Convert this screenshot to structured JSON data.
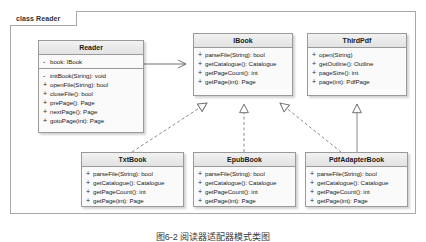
{
  "frame": {
    "label": "class Reader"
  },
  "classes": [
    {
      "id": "reader",
      "name": "Reader",
      "attributes": [
        {
          "visibility": "-",
          "signature": "book: IBook"
        }
      ],
      "operations": [
        {
          "visibility": "-",
          "signature": "initBook(String): void"
        },
        {
          "visibility": "+",
          "signature": "openFile(String): bool"
        },
        {
          "visibility": "+",
          "signature": "closeFile(): bool"
        },
        {
          "visibility": "+",
          "signature": "prePage(): Page"
        },
        {
          "visibility": "+",
          "signature": "nextPage(): Page"
        },
        {
          "visibility": "+",
          "signature": "gotoPage(int): Page"
        }
      ]
    },
    {
      "id": "ibook",
      "name": "IBook",
      "attributes": [],
      "operations": [
        {
          "visibility": "+",
          "signature": "parseFile(String): bool"
        },
        {
          "visibility": "+",
          "signature": "getCatalogue(): Catalogue"
        },
        {
          "visibility": "+",
          "signature": "getPageCount(): int"
        },
        {
          "visibility": "+",
          "signature": "getPage(int): Page"
        }
      ]
    },
    {
      "id": "thirdpdf",
      "name": "ThirdPdf",
      "attributes": [],
      "operations": [
        {
          "visibility": "+",
          "signature": "open(String)"
        },
        {
          "visibility": "+",
          "signature": "getOutline(): Outline"
        },
        {
          "visibility": "+",
          "signature": "pageSize(): int"
        },
        {
          "visibility": "+",
          "signature": "page(int): PdfPage"
        }
      ]
    },
    {
      "id": "txtbook",
      "name": "TxtBook",
      "attributes": [],
      "operations": [
        {
          "visibility": "+",
          "signature": "parseFile(String): bool"
        },
        {
          "visibility": "+",
          "signature": "getCatalogue(): Catalogue"
        },
        {
          "visibility": "+",
          "signature": "getPageCount(): int"
        },
        {
          "visibility": "+",
          "signature": "getPage(int): Page"
        }
      ]
    },
    {
      "id": "epubbook",
      "name": "EpubBook",
      "attributes": [],
      "operations": [
        {
          "visibility": "+",
          "signature": "parseFile(String): bool"
        },
        {
          "visibility": "+",
          "signature": "getCatalogue(): Catalogue"
        },
        {
          "visibility": "+",
          "signature": "getPageCount(): int"
        },
        {
          "visibility": "+",
          "signature": "getPage(int): Page"
        }
      ]
    },
    {
      "id": "pdfadapter",
      "name": "PdfAdapterBook",
      "attributes": [],
      "operations": [
        {
          "visibility": "+",
          "signature": "parseFile(String): bool"
        },
        {
          "visibility": "+",
          "signature": "getCatalogue(): Catalogue"
        },
        {
          "visibility": "+",
          "signature": "getPageCount(): int"
        },
        {
          "visibility": "+",
          "signature": "getPage(int): Page"
        }
      ]
    }
  ],
  "relationships": [
    {
      "from": "Reader",
      "to": "IBook",
      "type": "association"
    },
    {
      "from": "TxtBook",
      "to": "IBook",
      "type": "realization"
    },
    {
      "from": "EpubBook",
      "to": "IBook",
      "type": "realization"
    },
    {
      "from": "PdfAdapterBook",
      "to": "IBook",
      "type": "realization"
    },
    {
      "from": "PdfAdapterBook",
      "to": "ThirdPdf",
      "type": "generalization"
    }
  ],
  "caption": {
    "text": "图6-2  阅读器适配器模式类图"
  },
  "colors": {
    "frame_border": "#a8a8a8",
    "class_border": "#9a9a9a",
    "class_header": "#e8e8e8",
    "class_body": "#fafafa",
    "connector": "#7a7a7a",
    "text": "#1a1a1a"
  }
}
